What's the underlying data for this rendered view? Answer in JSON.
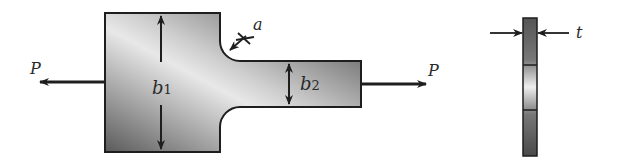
{
  "diagram": {
    "labels": {
      "load_left": "P",
      "load_right": "P",
      "wide_width_base": "b",
      "wide_width_sub": "1",
      "narrow_width_base": "b",
      "narrow_width_sub": "2",
      "fillet_radius": "a",
      "thickness": "t"
    },
    "colors": {
      "outline": "#1e1e1e",
      "fill_dark": "#5c5c5c",
      "fill_light": "#ececec",
      "text": "#2a2a2a"
    }
  }
}
